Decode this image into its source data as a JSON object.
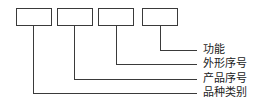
{
  "diagram": {
    "type": "code-structure",
    "boxes": 4,
    "labels": [
      {
        "text": "功能",
        "box": 4
      },
      {
        "text": "外形序号",
        "box": 3
      },
      {
        "text": "产品序号",
        "box": 2
      },
      {
        "text": "品种类别",
        "box": 1
      }
    ]
  }
}
